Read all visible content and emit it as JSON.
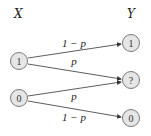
{
  "diagram": {
    "input_label": "X",
    "output_label": "Y",
    "input_nodes": [
      {
        "id": "x1",
        "label": "1"
      },
      {
        "id": "x0",
        "label": "0"
      }
    ],
    "output_nodes": [
      {
        "id": "y1",
        "label": "1"
      },
      {
        "id": "yq",
        "label": "?"
      },
      {
        "id": "y0",
        "label": "0"
      }
    ],
    "edges": [
      {
        "from": "x1",
        "to": "y1",
        "label": "1 − p"
      },
      {
        "from": "x1",
        "to": "yq",
        "label": "p"
      },
      {
        "from": "x0",
        "to": "yq",
        "label": "p"
      },
      {
        "from": "x0",
        "to": "y0",
        "label": "1 − p"
      }
    ],
    "colors": {
      "node_fill": "#e6e6e6",
      "node_stroke": "#7a7a7a",
      "edge": "#333333"
    }
  }
}
